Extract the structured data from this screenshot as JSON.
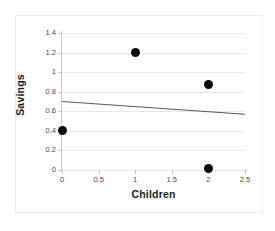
{
  "chart_data": {
    "type": "scatter",
    "title": "",
    "xlabel": "Children",
    "ylabel": "Savings",
    "xlim": [
      0,
      2.5
    ],
    "ylim": [
      0,
      1.4
    ],
    "grid": true,
    "legend": "none",
    "x_ticks": [
      "0",
      "0.5",
      "1",
      "1.5",
      "2",
      "2.5"
    ],
    "x_tick_values": [
      0,
      0.5,
      1,
      1.5,
      2,
      2.5
    ],
    "y_ticks": [
      "0",
      "0.2",
      "0.4",
      "0.6",
      "0.8",
      "1",
      "1.2",
      "1.4"
    ],
    "y_tick_values": [
      0,
      0.2,
      0.4,
      0.6,
      0.8,
      1,
      1.2,
      1.4
    ],
    "series": [
      {
        "name": "observations",
        "marker": "filled-circle",
        "color": "#0a0a0a",
        "points": [
          {
            "x": 0,
            "y": 0.4
          },
          {
            "x": 1,
            "y": 1.2
          },
          {
            "x": 2,
            "y": 0.87
          },
          {
            "x": 2,
            "y": 0.02
          }
        ]
      },
      {
        "name": "trendline",
        "type": "line",
        "color": "#595959",
        "x": [
          0,
          2.5
        ],
        "y": [
          0.7,
          0.57
        ]
      }
    ]
  },
  "axes": {
    "x_title": "Children",
    "y_title": "Savings"
  }
}
